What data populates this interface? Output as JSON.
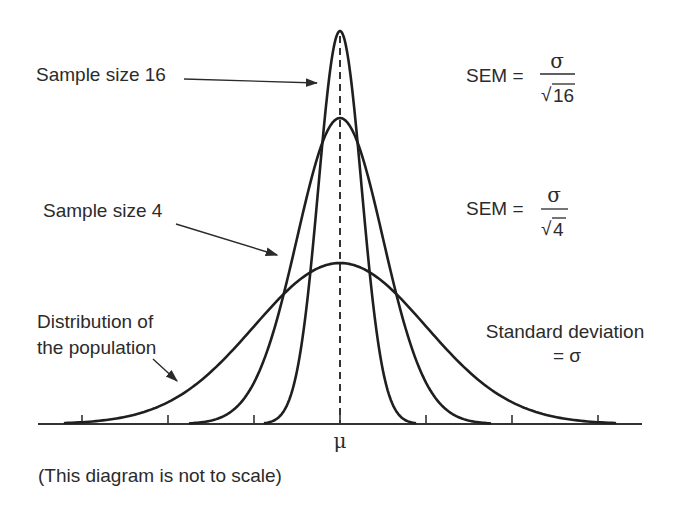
{
  "diagram": {
    "note": "(This diagram is not to scale)",
    "mean_symbol": "μ",
    "labels": {
      "sample16": "Sample size 16",
      "sample4": "Sample size 4",
      "population_line1": "Distribution of",
      "population_line2": "the population",
      "sd_line1": "Standard deviation",
      "sd_line2": "= σ"
    },
    "formulas": {
      "sem16": {
        "lhs": "SEM =",
        "numerator": "σ",
        "radical": "√",
        "radicand": "16"
      },
      "sem4": {
        "lhs": "SEM =",
        "numerator": "σ",
        "radical": "√",
        "radicand": "4"
      }
    }
  },
  "chart_data": {
    "type": "line",
    "title": "",
    "xlabel": "",
    "ylabel": "",
    "x_ticks": [
      "",
      "",
      "",
      "μ",
      "",
      "",
      ""
    ],
    "x_tick_units_in_sigma": [
      -3,
      -2,
      -1,
      0,
      1,
      2,
      3
    ],
    "grid": false,
    "legend": "inline annotations",
    "series": [
      {
        "name": "Distribution of the population",
        "sd": "σ",
        "sd_relative": 1.0,
        "relative_peak_height": 1.0
      },
      {
        "name": "Sample size 4",
        "sd": "σ/√4",
        "sd_relative": 0.5,
        "relative_peak_height": 1.9
      },
      {
        "name": "Sample size 16",
        "sd": "σ/√16",
        "sd_relative": 0.25,
        "relative_peak_height": 2.44
      }
    ],
    "annotations": [
      "SEM = σ/√16",
      "SEM = σ/√4",
      "Standard deviation = σ",
      "(This diagram is not to scale)"
    ]
  },
  "render": {
    "center_x": 340,
    "baseline_y": 424,
    "axis_x0": 38,
    "axis_x1": 642,
    "sigma_px": 86,
    "ticks_px": [
      82,
      168,
      254,
      340,
      426,
      512,
      598
    ],
    "curves": [
      {
        "id": "population",
        "sd_px": 86,
        "peak_px": 161,
        "half_span_px": 275
      },
      {
        "id": "sample4",
        "sd_px": 43,
        "peak_px": 306,
        "half_span_px": 150
      },
      {
        "id": "sample16",
        "sd_px": 21.5,
        "peak_px": 393,
        "half_span_px": 75
      }
    ]
  }
}
